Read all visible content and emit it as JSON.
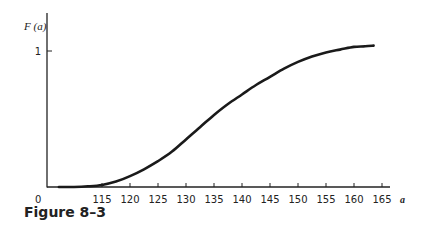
{
  "figure": {
    "caption": "Figure 8–3"
  },
  "chart_data": {
    "type": "line",
    "title": "",
    "xlabel": "a",
    "ylabel": "F (a)",
    "origin_label": "0",
    "x_ticks": [
      115,
      120,
      125,
      130,
      135,
      140,
      145,
      150,
      155,
      160,
      165
    ],
    "y_ticks": [
      1
    ],
    "xlim": [
      105,
      166.5
    ],
    "ylim": [
      0,
      1.0
    ],
    "grid": false,
    "legend": null,
    "series": [
      {
        "name": "F(a)",
        "x": [
          107.3,
          110,
          112.5,
          115,
          117.5,
          120,
          122.5,
          125,
          127.5,
          130,
          132.5,
          135,
          137.5,
          140,
          142.5,
          145,
          147.5,
          150,
          152.5,
          155,
          157.5,
          160,
          162,
          163.5
        ],
        "values": [
          0.0,
          0.0,
          0.005,
          0.015,
          0.04,
          0.08,
          0.13,
          0.19,
          0.26,
          0.35,
          0.44,
          0.53,
          0.61,
          0.68,
          0.75,
          0.81,
          0.87,
          0.92,
          0.96,
          0.99,
          1.01,
          1.03,
          1.035,
          1.04
        ]
      }
    ]
  }
}
